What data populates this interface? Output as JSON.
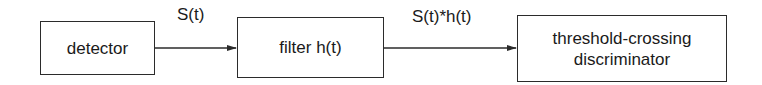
{
  "diagram": {
    "type": "block-diagram",
    "direction": "left-to-right",
    "blocks": [
      {
        "id": "detector",
        "lines": [
          "detector"
        ]
      },
      {
        "id": "filter",
        "lines": [
          "filter h(t)"
        ]
      },
      {
        "id": "threshold",
        "lines": [
          "threshold-crossing",
          "discriminator"
        ]
      }
    ],
    "connections": [
      {
        "from": "detector",
        "to": "filter",
        "label": "S(t)"
      },
      {
        "from": "filter",
        "to": "threshold",
        "label": "S(t)*h(t)"
      }
    ],
    "colors": {
      "stroke": "#2b2b2b",
      "text": "#1a1a1a",
      "background": "#ffffff"
    }
  }
}
